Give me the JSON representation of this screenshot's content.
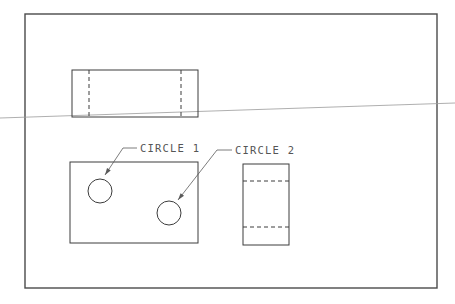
{
  "drawing": {
    "type": "orthographic-projection",
    "colors": {
      "background": "#ffffff",
      "line": "#3c3c3c",
      "leader": "#5a5a5a",
      "label": "#555555",
      "stray_line": "#9a9a9a"
    },
    "frame": {
      "x": 25,
      "y": 14,
      "width": 412,
      "height": 274
    },
    "views": {
      "top": {
        "rect": {
          "x": 72,
          "y": 70,
          "width": 126,
          "height": 47
        },
        "hidden_lines_x": [
          89,
          181
        ]
      },
      "front": {
        "rect": {
          "x": 70,
          "y": 162,
          "width": 128,
          "height": 81
        },
        "circles": [
          {
            "id": "circle-1",
            "cx": 100,
            "cy": 191,
            "r": 12
          },
          {
            "id": "circle-2",
            "cx": 169,
            "cy": 213,
            "r": 12
          }
        ]
      },
      "side": {
        "rect": {
          "x": 243,
          "y": 164,
          "width": 46,
          "height": 81
        },
        "hidden_lines_y": [
          181,
          227
        ]
      }
    },
    "annotations": [
      {
        "label": "CIRCLE 1",
        "label_x": 140,
        "label_y": 152,
        "leader": {
          "x1": 137,
          "y1": 148,
          "x2": 123,
          "y2": 148,
          "x3": 105,
          "y3": 175
        }
      },
      {
        "label": "CIRCLE 2",
        "label_x": 235,
        "label_y": 154,
        "leader": {
          "x1": 232,
          "y1": 150,
          "x2": 217,
          "y2": 150,
          "x3": 178,
          "y3": 200
        }
      }
    ],
    "stray_line": {
      "x1": 0,
      "y1": 118,
      "x2": 455,
      "y2": 103
    }
  }
}
